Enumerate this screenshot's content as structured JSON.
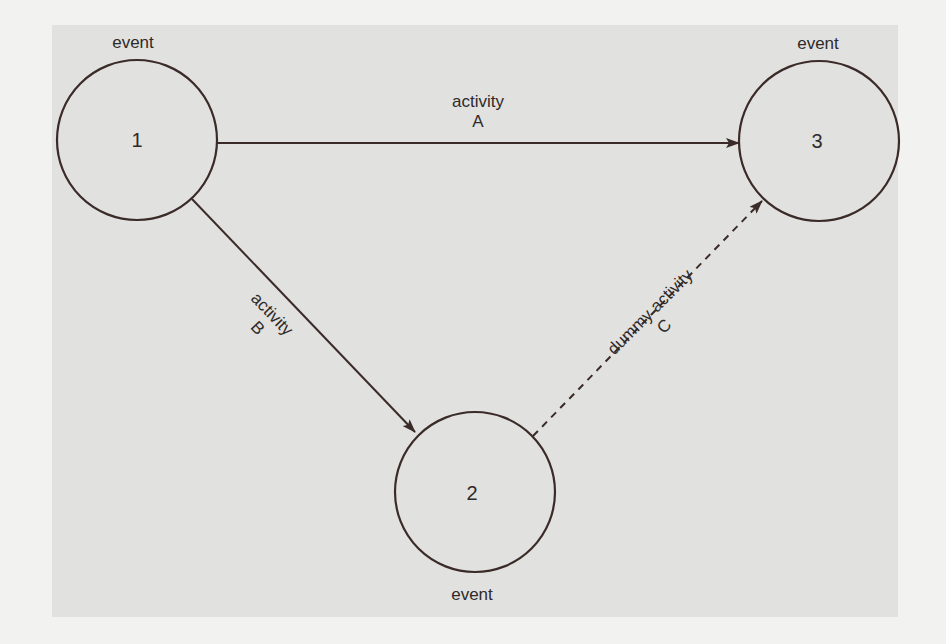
{
  "diagram": {
    "colors": {
      "page_background": "#f2f2f0",
      "panel_background": "#e1e1df",
      "ink": "#3a2b28",
      "text": "#2f2a29"
    },
    "nodes": [
      {
        "id": "1",
        "number": "1",
        "label": "event",
        "cx": 137,
        "cy": 140,
        "r": 80,
        "label_position": "above"
      },
      {
        "id": "2",
        "number": "2",
        "label": "event",
        "cx": 475,
        "cy": 492,
        "r": 80,
        "label_position": "below"
      },
      {
        "id": "3",
        "number": "3",
        "label": "event",
        "cx": 819,
        "cy": 141,
        "r": 80,
        "label_position": "above"
      }
    ],
    "edges": [
      {
        "id": "A",
        "from": "1",
        "to": "3",
        "style": "solid",
        "label_line1": "activity",
        "label_line2": "A"
      },
      {
        "id": "B",
        "from": "1",
        "to": "2",
        "style": "solid",
        "label_line1": "activity",
        "label_line2": "B"
      },
      {
        "id": "C",
        "from": "2",
        "to": "3",
        "style": "dashed",
        "label_line1": "dummy activity",
        "label_line2": "C"
      }
    ]
  }
}
